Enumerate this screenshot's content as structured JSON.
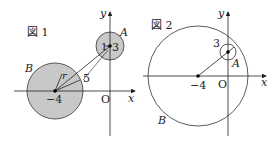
{
  "figure1": {
    "title": "図 1",
    "axis_x": "x",
    "axis_y": "y",
    "origin": "O",
    "circle_a_label": "A",
    "circle_b_label": "B",
    "center_b_label": "−4",
    "radius_a_label": "1",
    "center_a_label": "3",
    "radius_b_label": "r",
    "distance_label": "5",
    "fill_color": "#c8c8c8"
  },
  "figure2": {
    "title": "図 2",
    "axis_x": "x",
    "axis_y": "y",
    "origin": "O",
    "circle_a_label": "A",
    "circle_b_label": "B",
    "center_b_label": "−4",
    "radius_a_label": "3"
  }
}
